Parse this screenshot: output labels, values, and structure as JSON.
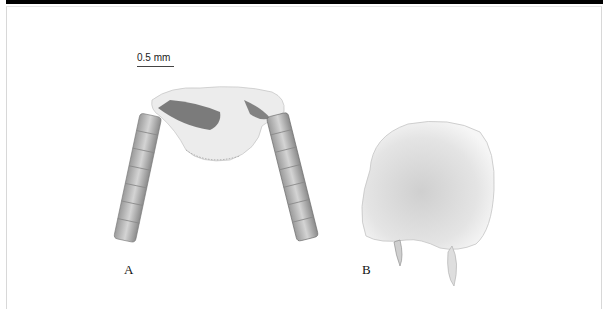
{
  "figure": {
    "scale_bar": {
      "label": "0.5 mm"
    },
    "panels": [
      {
        "id": "A",
        "label": "A",
        "subject": "head capsule with paired segmented antennae (dorsal view)"
      },
      {
        "id": "B",
        "label": "B",
        "subject": "sclerite plate with two spine-like processes"
      }
    ]
  }
}
